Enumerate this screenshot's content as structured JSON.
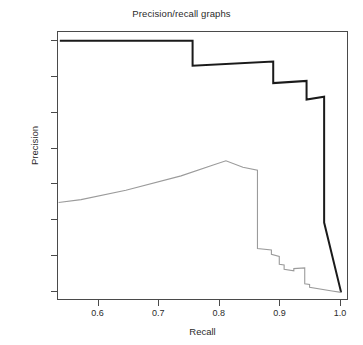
{
  "chart_data": {
    "type": "line",
    "title": "Precision/recall graphs",
    "xlabel": "Recall",
    "ylabel": "Precision",
    "xlim": [
      0.533,
      1.013
    ],
    "ylim": [
      0.638,
      1.012
    ],
    "grid": false,
    "legend": "none",
    "xticks": [
      0.6,
      0.7,
      0.8,
      0.9,
      1.0
    ],
    "xtick_labels": [
      "0.6",
      "0.7",
      "0.8",
      "0.9",
      "1.0"
    ],
    "yticks": [
      0.65,
      0.7,
      0.75,
      0.8,
      0.85,
      0.9,
      0.95,
      1.0
    ],
    "ytick_labels": [
      "0.65",
      "0.70",
      "0.75",
      "0.80",
      "0.85",
      "0.90",
      "0.95",
      "1.00"
    ],
    "series": [
      {
        "name": "upper-curve",
        "color": "#1a1a1a",
        "width": 2.0,
        "x": [
          0.536,
          0.755,
          0.755,
          0.888,
          0.888,
          0.943,
          0.943,
          0.972,
          0.972,
          1.0
        ],
        "y": [
          1.0,
          1.0,
          0.965,
          0.971,
          0.941,
          0.944,
          0.918,
          0.922,
          0.747,
          0.65
        ]
      },
      {
        "name": "lower-curve",
        "color": "#9b9b9b",
        "width": 1.1,
        "x": [
          0.534,
          0.571,
          0.645,
          0.736,
          0.789,
          0.81,
          0.838,
          0.862,
          0.862,
          0.885,
          0.885,
          0.898,
          0.898,
          0.906,
          0.906,
          0.922,
          0.922,
          0.94,
          0.94,
          0.948,
          0.948,
          0.985,
          1.0
        ],
        "y": [
          0.775,
          0.779,
          0.792,
          0.812,
          0.827,
          0.833,
          0.824,
          0.82,
          0.711,
          0.709,
          0.703,
          0.7,
          0.689,
          0.688,
          0.682,
          0.68,
          0.683,
          0.684,
          0.662,
          0.661,
          0.657,
          0.652,
          0.65
        ]
      }
    ]
  }
}
